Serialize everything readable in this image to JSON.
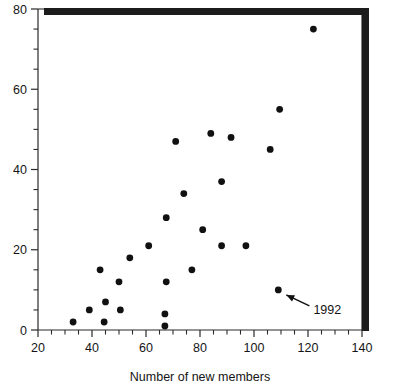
{
  "chart_data": {
    "type": "scatter",
    "title": "",
    "xlabel": "Number of new members",
    "ylabel": "",
    "xlim": [
      20,
      140
    ],
    "ylim": [
      0,
      80
    ],
    "x_ticks_major": [
      20,
      40,
      60,
      80,
      100,
      120,
      140
    ],
    "y_ticks_major": [
      0,
      20,
      40,
      60,
      80
    ],
    "x_tick_labels": [
      "20",
      "40",
      "60",
      "80",
      "100",
      "120",
      "140"
    ],
    "y_tick_labels": [
      "0",
      "20",
      "40",
      "60",
      "80"
    ],
    "x_minor_step": 5,
    "y_minor_step": 5,
    "grid": false,
    "legend": false,
    "marker": "filled-circle",
    "points": [
      {
        "x": 33,
        "y": 2
      },
      {
        "x": 39,
        "y": 5
      },
      {
        "x": 43,
        "y": 15
      },
      {
        "x": 44.5,
        "y": 2
      },
      {
        "x": 45,
        "y": 7
      },
      {
        "x": 50,
        "y": 12
      },
      {
        "x": 50.5,
        "y": 5
      },
      {
        "x": 54,
        "y": 18
      },
      {
        "x": 61,
        "y": 21
      },
      {
        "x": 67,
        "y": 4
      },
      {
        "x": 67,
        "y": 1
      },
      {
        "x": 67.5,
        "y": 12
      },
      {
        "x": 67.5,
        "y": 28
      },
      {
        "x": 71,
        "y": 47
      },
      {
        "x": 74,
        "y": 34
      },
      {
        "x": 77,
        "y": 15
      },
      {
        "x": 81,
        "y": 25
      },
      {
        "x": 84,
        "y": 49
      },
      {
        "x": 88,
        "y": 21
      },
      {
        "x": 88,
        "y": 37
      },
      {
        "x": 91.5,
        "y": 48
      },
      {
        "x": 97,
        "y": 21
      },
      {
        "x": 106,
        "y": 45
      },
      {
        "x": 109,
        "y": 10
      },
      {
        "x": 109.5,
        "y": 55
      },
      {
        "x": 122,
        "y": 75
      }
    ],
    "annotations": [
      {
        "label": "1992",
        "points_to": {
          "x": 109,
          "y": 10
        },
        "text_position": {
          "x": 122,
          "y": 5
        }
      }
    ]
  }
}
